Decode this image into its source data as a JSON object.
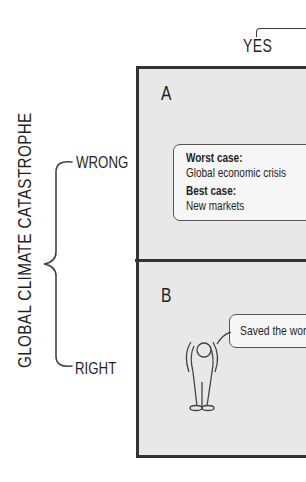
{
  "columns": {
    "header_label": "YES"
  },
  "rows": {
    "title": "GLOBAL CLIMATE CATASTROPHE",
    "labels": [
      "WRONG",
      "RIGHT"
    ]
  },
  "cells": [
    {
      "letter": "A",
      "callout": [
        {
          "text": "Worst case:",
          "bold": true
        },
        {
          "text": "Global economic crisis",
          "bold": false
        },
        {
          "text": "Best case:",
          "bold": true
        },
        {
          "text": "New markets",
          "bold": false
        }
      ]
    },
    {
      "letter": "B",
      "callout": [
        {
          "text": "Saved the world",
          "bold": false
        }
      ],
      "figure": "person-arms-raised"
    }
  ],
  "colors": {
    "cell_fill": "#e8e8e8",
    "border": "#333333",
    "callout_fill": "#f6f6f6",
    "text": "#1f1f1f"
  }
}
